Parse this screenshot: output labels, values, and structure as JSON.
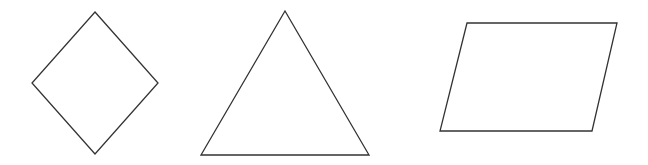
{
  "diagram": {
    "stroke_color": "#333333",
    "background": "#ffffff",
    "shapes": [
      {
        "name": "rhombus",
        "points": "95,12 158,83 95,154 32,83"
      },
      {
        "name": "triangle",
        "points": "285,11 369,155 201,155"
      },
      {
        "name": "parallelogram",
        "points": "467,23 617,23 592,131 440,131"
      }
    ]
  }
}
